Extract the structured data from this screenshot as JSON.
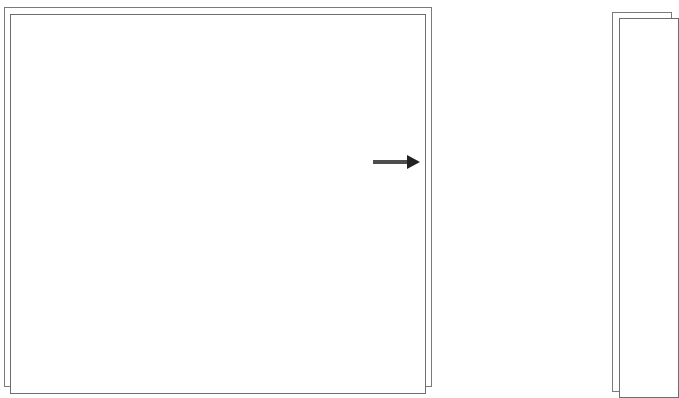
{
  "panels": [
    {
      "id": "left-panel",
      "style": "double-border",
      "content": ""
    },
    {
      "id": "right-panel",
      "style": "double-border",
      "content": ""
    }
  ],
  "arrow": {
    "direction": "right",
    "color": "#2b2b2b"
  },
  "colors": {
    "background": "#ffffff",
    "border": "#777777"
  }
}
